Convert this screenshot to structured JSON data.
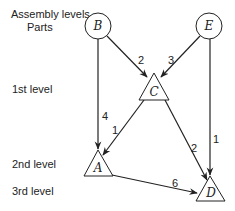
{
  "labels": {
    "assembly_levels": "Assembly levels",
    "parts": "Parts",
    "level1": "1st level",
    "level2": "2nd level",
    "level3": "3rd level"
  },
  "nodes": {
    "B": {
      "label": "B",
      "shape": "circle"
    },
    "E": {
      "label": "E",
      "shape": "circle"
    },
    "C": {
      "label": "C",
      "shape": "triangle"
    },
    "A": {
      "label": "A",
      "shape": "triangle"
    },
    "D": {
      "label": "D",
      "shape": "triangle"
    }
  },
  "edges": [
    {
      "from": "B",
      "to": "C",
      "weight": "2"
    },
    {
      "from": "E",
      "to": "C",
      "weight": "3"
    },
    {
      "from": "B",
      "to": "A",
      "weight": "4"
    },
    {
      "from": "C",
      "to": "A",
      "weight": "1"
    },
    {
      "from": "C",
      "to": "D",
      "weight": "2"
    },
    {
      "from": "E",
      "to": "D",
      "weight": "1"
    },
    {
      "from": "A",
      "to": "D",
      "weight": "6"
    }
  ]
}
